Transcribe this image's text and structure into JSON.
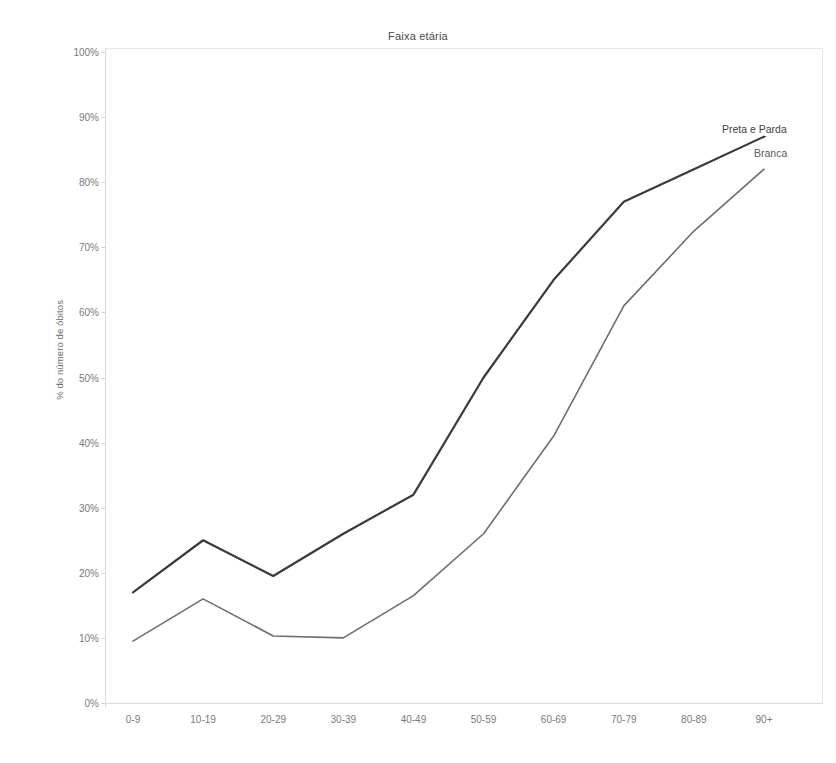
{
  "chart": {
    "title": "Faixa etária",
    "ylabel": "% do número de óbitos"
  },
  "annotations": {
    "preta_e_parda": "Preta e Parda",
    "branca": "Branca"
  },
  "axis": {
    "y_ticks": [
      "100%",
      "90%",
      "80%",
      "70%",
      "60%",
      "50%",
      "40%",
      "30%",
      "20%",
      "10%",
      "0%"
    ],
    "x_ticks": [
      "0-9",
      "10-19",
      "20-29",
      "30-39",
      "40-49",
      "50-59",
      "60-69",
      "70-79",
      "80-89",
      "90+"
    ]
  },
  "colors": {
    "preta_e_parda": "#3a3a3a",
    "branca": "#6e6e6e",
    "axis": "#d9d9d9",
    "tick_text": "#7a7a7a"
  },
  "chart_data": {
    "type": "line",
    "title": "Faixa etária",
    "xlabel": "",
    "ylabel": "% do número de óbitos",
    "ylim": [
      0,
      100
    ],
    "ytick_step": 10,
    "grid": false,
    "legend": "inline-annotation-right",
    "categories": [
      "0-9",
      "10-19",
      "20-29",
      "30-39",
      "40-49",
      "50-59",
      "60-69",
      "70-79",
      "80-89",
      "90+"
    ],
    "series": [
      {
        "name": "Preta e Parda",
        "color": "#3a3a3a",
        "values": [
          17,
          25,
          19.5,
          26,
          32,
          50,
          65,
          77,
          82,
          87
        ]
      },
      {
        "name": "Branca",
        "color": "#6e6e6e",
        "values": [
          9.5,
          16,
          10.3,
          10,
          16.5,
          26,
          41,
          61,
          72.5,
          82
        ]
      }
    ]
  }
}
